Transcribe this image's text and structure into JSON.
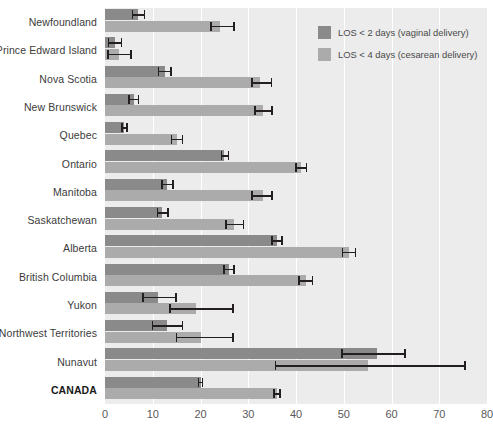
{
  "legend": {
    "position": "top-right",
    "items": [
      {
        "label": "LOS < 2 days (vaginal delivery)",
        "color": "#8a8a8a",
        "name": "vaginal"
      },
      {
        "label": "LOS < 4 days (cesarean delivery)",
        "color": "#ababab",
        "name": "cesarean"
      }
    ]
  },
  "axis": {
    "ticks": [
      "0",
      "10",
      "20",
      "30",
      "40",
      "50",
      "60",
      "70",
      "80"
    ]
  },
  "chart_data": {
    "type": "bar",
    "orientation": "horizontal",
    "title": "",
    "xlabel": "",
    "ylabel": "",
    "xlim": [
      0,
      80
    ],
    "xticks": [
      0,
      10,
      20,
      30,
      40,
      50,
      60,
      70,
      80
    ],
    "grid": true,
    "legend_position": "top-right",
    "categories": [
      "Newfoundland",
      "Prince Edward Island",
      "Nova Scotia",
      "New Brunswick",
      "Quebec",
      "Ontario",
      "Manitoba",
      "Saskatchewan",
      "Alberta",
      "British Columbia",
      "Yukon",
      "Northwest Territories",
      "Nunavut",
      "CANADA"
    ],
    "emphasized_category": "CANADA",
    "series": [
      {
        "name": "LOS < 2 days (vaginal delivery)",
        "color": "#8a8a8a",
        "values": [
          7.0,
          2.0,
          12.5,
          6.0,
          4.0,
          25.0,
          13.0,
          12.0,
          36.0,
          26.0,
          11.0,
          13.0,
          57.0,
          20.0
        ],
        "ci_low": [
          5.6,
          0.6,
          11.0,
          4.8,
          3.4,
          24.2,
          11.8,
          10.8,
          34.8,
          24.8,
          7.8,
          9.8,
          49.5,
          19.4
        ],
        "ci_high": [
          8.4,
          3.6,
          14.0,
          7.2,
          4.8,
          26.0,
          14.4,
          13.4,
          37.2,
          27.2,
          15.0,
          16.4,
          63.0,
          20.6
        ]
      },
      {
        "name": "LOS < 4 days (cesarean delivery)",
        "color": "#ababab",
        "values": [
          24.0,
          3.0,
          32.5,
          33.0,
          15.0,
          41.0,
          33.0,
          27.0,
          51.0,
          42.0,
          19.0,
          20.0,
          55.0,
          36.0
        ],
        "ci_low": [
          22.0,
          0.5,
          30.6,
          31.2,
          13.8,
          39.8,
          30.6,
          25.2,
          49.6,
          40.4,
          13.5,
          14.8,
          35.5,
          35.2
        ],
        "ci_high": [
          27.2,
          5.6,
          35.0,
          35.2,
          16.4,
          42.4,
          35.2,
          29.2,
          52.6,
          43.6,
          27.0,
          27.0,
          75.5,
          36.8
        ]
      }
    ]
  }
}
